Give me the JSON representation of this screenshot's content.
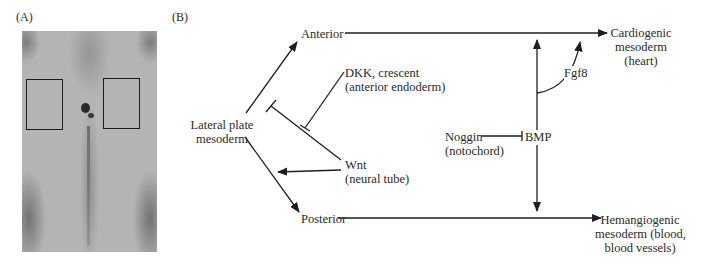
{
  "panel_a": {
    "label": "(A)",
    "image": {
      "description": "embryo-micrograph",
      "boxes": [
        {
          "name": "left-box",
          "x": 4,
          "y": 48,
          "w": 36,
          "h": 50
        },
        {
          "name": "right-box",
          "x": 81,
          "y": 47,
          "w": 36,
          "h": 50
        }
      ]
    }
  },
  "panel_b": {
    "label": "(B)",
    "nodes": {
      "lateral_plate": {
        "line1": "Lateral plate",
        "line2": "mesoderm"
      },
      "anterior": {
        "text": "Anterior"
      },
      "posterior": {
        "text": "Posterior"
      },
      "dkk": {
        "line1": "DKK, crescent",
        "line2": "(anterior endoderm)"
      },
      "wnt": {
        "line1": "Wnt",
        "line2": "(neural tube)"
      },
      "noggin": {
        "line1": "Noggin",
        "line2": "(notochord)"
      },
      "bmp": {
        "text": "BMP"
      },
      "fgf8": {
        "text": "Fgf8"
      },
      "cardiogenic": {
        "line1": "Cardiogenic",
        "line2": "mesoderm",
        "line3": "(heart)"
      },
      "hemangiogenic": {
        "line1": "Hemangiogenic",
        "line2": "mesoderm (blood,",
        "line3": "blood vessels)"
      }
    },
    "edges": [
      {
        "from": "Lateral plate mesoderm",
        "to": "Anterior",
        "type": "activate"
      },
      {
        "from": "Lateral plate mesoderm",
        "to": "Posterior",
        "type": "activate"
      },
      {
        "from": "Anterior",
        "to": "Cardiogenic mesoderm (heart)",
        "type": "activate"
      },
      {
        "from": "Posterior",
        "to": "Hemangiogenic mesoderm (blood, blood vessels)",
        "type": "activate"
      },
      {
        "from": "Wnt",
        "to": "Anterior pathway",
        "type": "inhibit"
      },
      {
        "from": "DKK, crescent",
        "to": "Wnt",
        "type": "inhibit"
      },
      {
        "from": "Wnt",
        "to": "Posterior pathway",
        "type": "activate"
      },
      {
        "from": "Noggin",
        "to": "BMP",
        "type": "inhibit"
      },
      {
        "from": "BMP",
        "to": "Cardiogenic mesoderm",
        "type": "activate"
      },
      {
        "from": "BMP",
        "to": "Hemangiogenic mesoderm",
        "type": "activate"
      },
      {
        "from": "BMP",
        "to": "Fgf8",
        "type": "activate"
      },
      {
        "from": "Fgf8",
        "to": "Cardiogenic mesoderm",
        "type": "activate"
      }
    ]
  },
  "colors": {
    "line": "#1e1e1e",
    "text": "#2a2a2a",
    "photo_gray": "#b4b4b4"
  }
}
